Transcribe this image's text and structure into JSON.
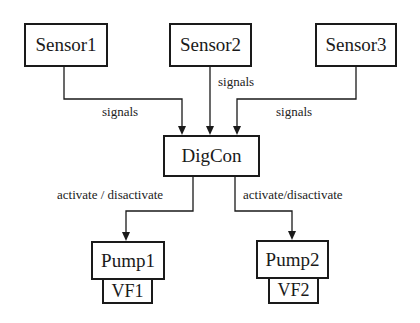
{
  "diagram": {
    "nodes": {
      "sensor1": {
        "label": "Sensor1"
      },
      "sensor2": {
        "label": "Sensor2"
      },
      "sensor3": {
        "label": "Sensor3"
      },
      "digcon": {
        "label": "DigCon"
      },
      "pump1": {
        "label": "Pump1",
        "sub_label": "VF1"
      },
      "pump2": {
        "label": "Pump2",
        "sub_label": "VF2"
      }
    },
    "edges": [
      {
        "from": "Sensor1",
        "to": "DigCon",
        "label": "signals"
      },
      {
        "from": "Sensor2",
        "to": "DigCon",
        "label": "signals"
      },
      {
        "from": "Sensor3",
        "to": "DigCon",
        "label": "signals"
      },
      {
        "from": "DigCon",
        "to": "Pump1",
        "label": "activate / disactivate"
      },
      {
        "from": "DigCon",
        "to": "Pump2",
        "label": "activate/disactivate"
      }
    ],
    "colors": {
      "stroke": "#1a1a1a",
      "background": "#ffffff"
    }
  }
}
